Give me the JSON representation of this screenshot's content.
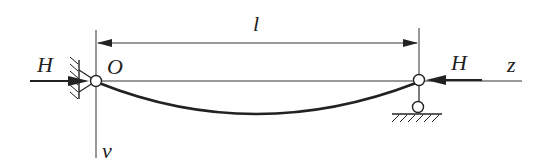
{
  "diagram": {
    "title": "",
    "labels": {
      "force_left": "H",
      "force_right": "H",
      "origin": "O",
      "span": "l",
      "axis_z": "z",
      "axis_v": "v"
    },
    "elements": {
      "beam": "straight reference chord from O to right support",
      "deflected_curve": "sagging curve below chord",
      "left_support": "hinged wall support at O",
      "right_support": "roller/pin support on ground",
      "dimension": "span l between supports"
    },
    "colors": {
      "stroke": "#222222",
      "background": "#ffffff"
    }
  }
}
